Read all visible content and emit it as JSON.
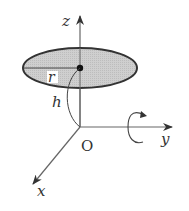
{
  "diagram": {
    "type": "3d-coordinate-figure",
    "axes": {
      "z_label": "z",
      "y_label": "y",
      "x_label": "x",
      "origin_label": "O"
    },
    "disk": {
      "radius_label": "r",
      "height_label": "h",
      "fill_color": "#c8c8c8",
      "edge_color": "#333333"
    },
    "rotation": {
      "about_axis": "y",
      "symbol": "rotation-arrow"
    },
    "colors": {
      "axis": "#555555",
      "text": "#333333",
      "background": "#ffffff"
    }
  }
}
